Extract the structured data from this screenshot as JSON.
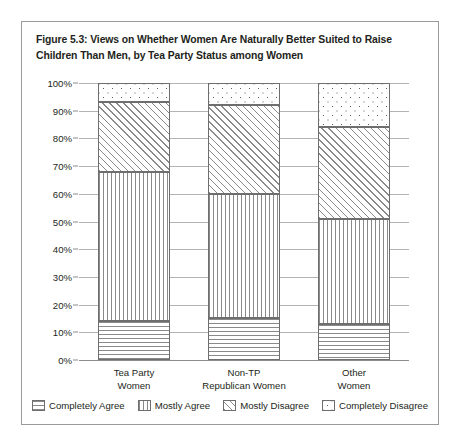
{
  "figure": {
    "title": "Figure 5.3: Views on Whether Women Are Naturally Better Suited to Raise Children Than Men, by Tea Party Status among Women"
  },
  "chart_data": {
    "type": "bar",
    "stacked": true,
    "stack_total": 100,
    "title": "Figure 5.3: Views on Whether Women Are Naturally Better Suited to Raise Children Than Men, by Tea Party Status among Women",
    "xlabel": "",
    "ylabel": "",
    "ylim": [
      0,
      100
    ],
    "yticks": [
      "0%",
      "10%",
      "20%",
      "30%",
      "40%",
      "50%",
      "60%",
      "70%",
      "80%",
      "90%",
      "100%"
    ],
    "ytick_values": [
      0,
      10,
      20,
      30,
      40,
      50,
      60,
      70,
      80,
      90,
      100
    ],
    "grid": true,
    "legend_position": "bottom",
    "categories": [
      {
        "line1": "Tea Party",
        "line2": "Women"
      },
      {
        "line1": "Non-TP",
        "line2": "Republican Women"
      },
      {
        "line1": "Other",
        "line2": "Women"
      }
    ],
    "category_labels": [
      "Tea Party Women",
      "Non-TP Republican Women",
      "Other Women"
    ],
    "series": [
      {
        "name": "Completely Agree",
        "pattern": "horizontal-lines",
        "values": [
          14,
          15,
          13
        ]
      },
      {
        "name": "Mostly Agree",
        "pattern": "vertical-lines",
        "values": [
          54,
          45,
          38
        ]
      },
      {
        "name": "Mostly Disagree",
        "pattern": "diagonal-hatch",
        "values": [
          25,
          32,
          33
        ]
      },
      {
        "name": "Completely Disagree",
        "pattern": "dots",
        "values": [
          7,
          8,
          16
        ]
      }
    ],
    "cumulative_tops": {
      "Tea Party Women": [
        14,
        68,
        93,
        100
      ],
      "Non-TP Republican Women": [
        15,
        60,
        92,
        100
      ],
      "Other Women": [
        13,
        51,
        84,
        100
      ]
    },
    "colors": {
      "fill": "#ffffff",
      "pattern_ink": "#8a8a8a",
      "segment_border": "#6e6e6e",
      "gridline": "#b3b3b3",
      "text": "#231f20",
      "frame": "#9a9a9a"
    }
  },
  "legend": {
    "items": [
      {
        "label": "Completely Agree"
      },
      {
        "label": "Mostly Agree"
      },
      {
        "label": "Mostly Disagree"
      },
      {
        "label": "Completely Disagree"
      }
    ]
  }
}
